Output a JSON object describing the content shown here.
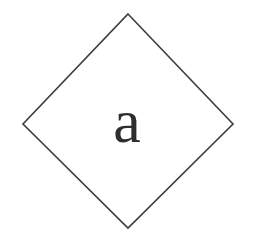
{
  "canvas": {
    "width": 259,
    "height": 252,
    "background_color": "#ffffff"
  },
  "logo": {
    "name": "diamond-monogram-logo",
    "monogram_letter": "a",
    "letter_color": "#2e2e2e",
    "letter_font_style": "serif",
    "outline_color": "#3d3d3d",
    "outline_width_px": 1.6,
    "shape": "diamond",
    "vertices": {
      "top": "128,14",
      "right": "233,124",
      "bottom": "128,228",
      "left": "23,124"
    },
    "points_attr": "128,14 233,124 128,228 23,124",
    "letter_x": 127,
    "letter_y": 142
  }
}
